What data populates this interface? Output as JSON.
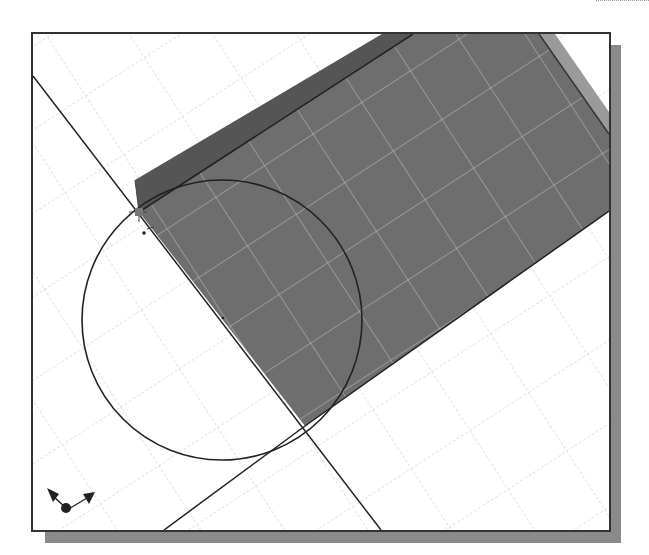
{
  "window": {
    "title": "",
    "type": "cad-graphics-viewport"
  },
  "viewport": {
    "background": "#ffffff",
    "frame_color": "#333333",
    "shadow_color": "#8a8a8a",
    "grid_color": "#c8c8c8",
    "grid_on_solid_color": "#bdbdbd"
  },
  "model": {
    "solid_face_color": "#6e6e6e",
    "solid_top_face_color": "#555555",
    "solid_side_face_color": "#9a9a9a",
    "sketch_line_color": "#222222"
  },
  "sketch": {
    "circle": {
      "cx": 189,
      "cy": 286,
      "r": 140
    },
    "start_point_icon": "sketch-point-marker",
    "lines": [
      "construction-diagonal",
      "tangent-line",
      "edge-line"
    ]
  },
  "triad": {
    "icon": "coordinate-axes-triad-icon"
  }
}
